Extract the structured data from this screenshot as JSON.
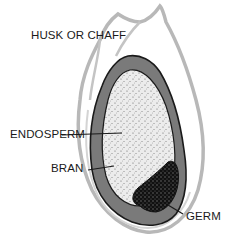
{
  "diagram": {
    "labels": {
      "husk": "HUSK OR CHAFF",
      "endosperm": "ENDOSPERM",
      "bran": "BRAN",
      "germ": "GERM"
    },
    "colors": {
      "husk_outline": "#b8b8b8",
      "bran_fill": "#7a7a7a",
      "endosperm_fill": "#ececec",
      "germ_fill": "#111111",
      "ink": "#1a1a1a"
    }
  }
}
